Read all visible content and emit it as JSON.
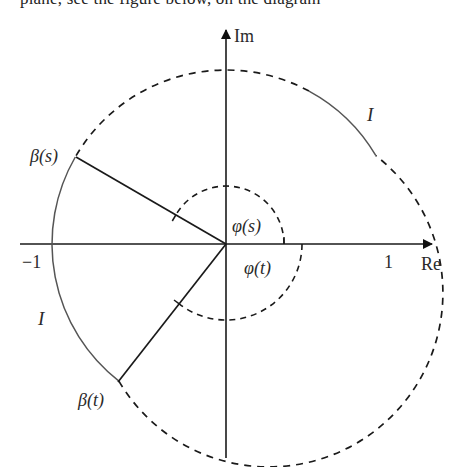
{
  "top_text": "plane, see the figure below, on the diagram",
  "diagram": {
    "axes": {
      "x_label": "Re",
      "y_label": "Im"
    },
    "ticks": {
      "minus_one": "−1",
      "one": "1"
    },
    "points": {
      "beta_s": "β(s)",
      "beta_t": "β(t)"
    },
    "angles": {
      "phi_s": "φ(s)",
      "phi_t": "φ(t)"
    },
    "arcs": {
      "interval_left": "I",
      "interval_right": "I"
    },
    "colors": {
      "line": "#1a1a1a",
      "arc": "#555555"
    }
  }
}
